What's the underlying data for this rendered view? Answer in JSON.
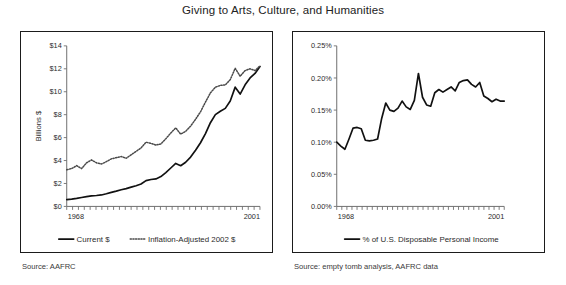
{
  "title": "Giving to Arts, Culture, and Humanities",
  "panels": {
    "left": {
      "source": "Source: AAFRC",
      "ylabel": "Billions $",
      "x_start_label": "1968",
      "x_end_label": "2001",
      "legend": [
        {
          "label": "Current $",
          "style": "solid"
        },
        {
          "label": "Inflation-Adjusted 2002 $",
          "style": "dotted"
        }
      ]
    },
    "right": {
      "source": "Source: empty tomb analysis, AAFRC data",
      "ylabel": "",
      "x_start_label": "1968",
      "x_end_label": "2001",
      "legend": [
        {
          "label": "% of U.S. Disposable Personal Income",
          "style": "solid"
        }
      ]
    }
  },
  "chart_data": [
    {
      "id": "arts-giving-dollars",
      "type": "line",
      "title": "Giving to Arts, Culture, and Humanities",
      "xlabel": "",
      "ylabel": "Billions $",
      "xlim": [
        1968,
        2001
      ],
      "ylim": [
        0,
        14
      ],
      "yticks": [
        0,
        2,
        4,
        6,
        8,
        10,
        12,
        14
      ],
      "ytick_labels": [
        "$0",
        "$2",
        "$4",
        "$6",
        "$8",
        "$10",
        "$12",
        "$14"
      ],
      "xticks": [
        1968,
        2001
      ],
      "xtick_labels": [
        "1968",
        "2001"
      ],
      "grid": false,
      "legend_position": "bottom",
      "x": [
        1968,
        1969,
        1970,
        1971,
        1972,
        1973,
        1974,
        1975,
        1976,
        1977,
        1978,
        1979,
        1980,
        1981,
        1982,
        1983,
        1984,
        1985,
        1986,
        1987,
        1988,
        1989,
        1990,
        1991,
        1992,
        1993,
        1994,
        1995,
        1996,
        1997,
        1998,
        1999,
        2000,
        2001
      ],
      "series": [
        {
          "name": "Current $",
          "style": "solid",
          "values": [
            0.6,
            0.63,
            0.7,
            0.78,
            0.85,
            0.92,
            0.95,
            1.0,
            1.1,
            1.22,
            1.33,
            1.45,
            1.55,
            1.68,
            1.8,
            1.95,
            2.25,
            2.35,
            2.4,
            2.6,
            2.95,
            3.35,
            3.75,
            3.55,
            3.85,
            4.3,
            4.9,
            5.55,
            6.35,
            7.3,
            8.0,
            8.3,
            8.55,
            9.2,
            10.4,
            9.8,
            10.6,
            11.2,
            11.6,
            12.2
          ]
        },
        {
          "name": "Inflation-Adjusted 2002 $",
          "style": "dotted",
          "values": [
            3.2,
            3.3,
            3.55,
            3.3,
            3.8,
            4.05,
            3.8,
            3.7,
            3.9,
            4.15,
            4.25,
            4.35,
            4.2,
            4.5,
            4.8,
            5.1,
            5.6,
            5.5,
            5.35,
            5.45,
            5.9,
            6.4,
            6.85,
            6.3,
            6.55,
            7.0,
            7.6,
            8.25,
            9.1,
            9.9,
            10.4,
            10.55,
            10.6,
            11.05,
            12.05,
            11.35,
            11.85,
            12.0,
            11.85,
            12.25
          ]
        }
      ]
    },
    {
      "id": "arts-giving-percent-dpi",
      "type": "line",
      "title": "Giving to Arts, Culture, and Humanities",
      "xlabel": "",
      "ylabel": "",
      "xlim": [
        1968,
        2001
      ],
      "ylim": [
        0.0,
        0.25
      ],
      "yticks": [
        0.0,
        0.05,
        0.1,
        0.15,
        0.2,
        0.25
      ],
      "ytick_labels": [
        "0.00%",
        "0.05%",
        "0.10%",
        "0.15%",
        "0.20%",
        "0.25%"
      ],
      "xticks": [
        1968,
        2001
      ],
      "xtick_labels": [
        "1968",
        "2001"
      ],
      "grid": false,
      "legend_position": "bottom",
      "x": [
        1968,
        1969,
        1970,
        1971,
        1972,
        1973,
        1974,
        1975,
        1976,
        1977,
        1978,
        1979,
        1980,
        1981,
        1982,
        1983,
        1984,
        1985,
        1986,
        1987,
        1988,
        1989,
        1990,
        1991,
        1992,
        1993,
        1994,
        1995,
        1996,
        1997,
        1998,
        1999,
        2000,
        2001
      ],
      "series": [
        {
          "name": "% of U.S. Disposable Personal Income",
          "style": "solid",
          "values": [
            0.1,
            0.094,
            0.089,
            0.105,
            0.122,
            0.123,
            0.121,
            0.103,
            0.102,
            0.103,
            0.105,
            0.137,
            0.161,
            0.15,
            0.148,
            0.153,
            0.164,
            0.155,
            0.151,
            0.165,
            0.207,
            0.17,
            0.158,
            0.156,
            0.177,
            0.182,
            0.178,
            0.182,
            0.186,
            0.18,
            0.193,
            0.196,
            0.197,
            0.19,
            0.186,
            0.193,
            0.172,
            0.168,
            0.163,
            0.167,
            0.164,
            0.164
          ]
        }
      ]
    }
  ]
}
